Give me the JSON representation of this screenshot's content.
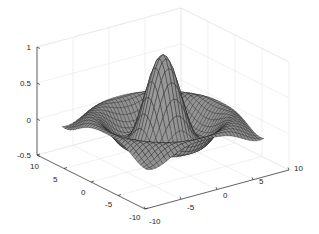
{
  "chart_data": {
    "type": "surface",
    "title": "",
    "xlabel": "",
    "ylabel": "",
    "zlabel": "",
    "function": "z = sin(r)/r, r = sqrt(x^2 + y^2)",
    "x_range": [
      -8,
      8
    ],
    "y_range": [
      -8,
      8
    ],
    "grid_points": 33,
    "xlim": [
      -10,
      10
    ],
    "ylim": [
      -10,
      10
    ],
    "zlim": [
      -0.5,
      1
    ],
    "x_ticks": [
      -10,
      -5,
      0,
      5,
      10
    ],
    "y_ticks": [
      10,
      5,
      0,
      -5,
      -10
    ],
    "z_ticks": [
      1,
      0.5,
      0,
      -0.5
    ],
    "x_tick_labels": [
      "-10",
      "-5",
      "0",
      "5",
      "10"
    ],
    "y_tick_labels": [
      "10",
      "5",
      "0",
      "-5",
      "-10"
    ],
    "z_tick_labels": [
      "1",
      "0.5",
      "0",
      "-0.5"
    ],
    "peak_value": 1,
    "grid": true,
    "legend": null,
    "colors": {
      "surface_light": "#9a9a9a",
      "surface_dark": "#555555",
      "mesh": "#1a1a1a",
      "grid": "#e6e6e6",
      "axis": "#262626",
      "background": "#ffffff"
    }
  },
  "projection": {
    "left_top": [
      37,
      47
    ],
    "left_bottom": [
      37,
      155
    ],
    "front_bottom": [
      145,
      209
    ],
    "right_bottom": [
      289,
      170
    ]
  }
}
